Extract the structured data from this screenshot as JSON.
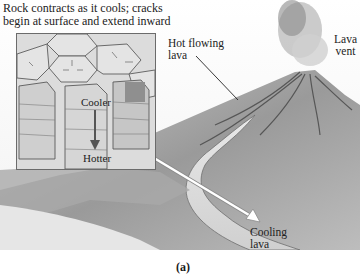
{
  "figure": {
    "panel_label": "(a)",
    "style": "grayscale textbook illustration",
    "colors": {
      "background": "#ffffff",
      "text": "#222222",
      "inset_border": "#6b6b6b",
      "arrow": "#555555",
      "pointer_arrow": "#ffffff"
    }
  },
  "inset": {
    "title_line1": "Rock contracts as it cools; cracks",
    "title_line2": "begin at surface and extend inward",
    "top_label": "Cooler",
    "bottom_label": "Hotter"
  },
  "labels": {
    "hot_flowing_line1": "Hot flowing",
    "hot_flowing_line2": "lava",
    "vent_line1": "Lava",
    "vent_line2": "vent",
    "cooling_line1": "Cooling",
    "cooling_line2": "lava"
  }
}
